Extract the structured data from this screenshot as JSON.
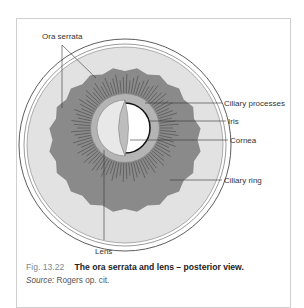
{
  "diagram": {
    "labels": {
      "ora_serrata": "Ora serrata",
      "ciliary_processes": "Ciliary processes",
      "iris": "Iris",
      "cornea": "Cornea",
      "ciliary_ring": "Ciliary ring",
      "lens": "Lens"
    },
    "colors": {
      "outer_sclera": "#ffffff",
      "retina": "#d8d8d8",
      "ciliary_ring": "#8a8a8a",
      "iris": "#b0b0b0",
      "lens": "#e6e6e6",
      "line": "#333333"
    }
  },
  "caption": {
    "figure_number": "Fig. 13.22",
    "title": "The ora serrata and lens – posterior view.",
    "source_label": "Source:",
    "source_text": " Rogers op. cit."
  }
}
